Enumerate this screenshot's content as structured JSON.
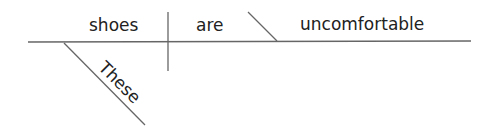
{
  "diagram": {
    "type": "sentence-diagram",
    "subject": "shoes",
    "verb": "are",
    "predicate_adjective": "uncomfortable",
    "modifier": "These",
    "line_color": "#666666",
    "text_color": "#222222"
  }
}
